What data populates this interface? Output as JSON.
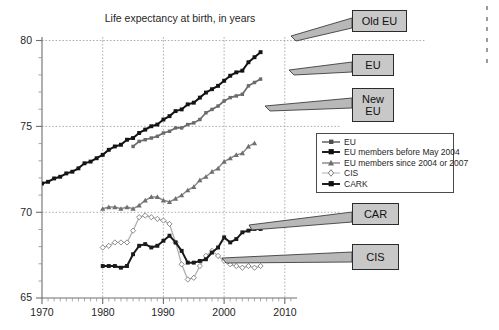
{
  "chart_data": {
    "type": "line",
    "title": "Life expectancy at birth, in years",
    "xlabel": "",
    "ylabel": "",
    "xlim": [
      1970,
      2012
    ],
    "ylim": [
      65,
      80.5
    ],
    "xticks": [
      "1970",
      "1980",
      "1990",
      "2000",
      "2010"
    ],
    "yticks": [
      "65",
      "70",
      "75",
      "80"
    ],
    "grid": true,
    "grid_style": "dotted",
    "legend_position": "middle-right",
    "minor_tick_interval": 1,
    "series": [
      {
        "name": "EU",
        "legend_label": "EU",
        "color": "#6b6b6b",
        "marker": "square-small",
        "x": [
          1985,
          1986,
          1987,
          1988,
          1989,
          1990,
          1991,
          1992,
          1993,
          1994,
          1995,
          1996,
          1997,
          1998,
          1999,
          2000,
          2001,
          2002,
          2003,
          2004,
          2005,
          2006
        ],
        "y": [
          74.0,
          74.3,
          74.4,
          74.5,
          74.6,
          74.8,
          74.9,
          75.1,
          75.1,
          75.3,
          75.4,
          75.6,
          76.0,
          76.2,
          76.4,
          76.7,
          76.9,
          77.0,
          77.1,
          77.6,
          77.8,
          78.0
        ]
      },
      {
        "name": "Old EU",
        "legend_label": "EU members before May 2004",
        "color": "#141414",
        "marker": "square-small",
        "x": [
          1970,
          1971,
          1972,
          1973,
          1974,
          1975,
          1976,
          1977,
          1978,
          1979,
          1980,
          1981,
          1982,
          1983,
          1984,
          1985,
          1986,
          1987,
          1988,
          1989,
          1990,
          1991,
          1992,
          1993,
          1994,
          1995,
          1996,
          1997,
          1998,
          1999,
          2000,
          2001,
          2002,
          2003,
          2004,
          2005,
          2006
        ],
        "y": [
          71.8,
          71.9,
          72.1,
          72.2,
          72.4,
          72.5,
          72.7,
          73.0,
          73.1,
          73.3,
          73.5,
          73.8,
          74.0,
          74.1,
          74.4,
          74.5,
          74.8,
          75.0,
          75.2,
          75.3,
          75.6,
          75.8,
          76.1,
          76.2,
          76.5,
          76.6,
          76.9,
          77.2,
          77.4,
          77.6,
          77.9,
          78.2,
          78.4,
          78.5,
          79.0,
          79.3,
          79.6
        ]
      },
      {
        "name": "New EU",
        "legend_label": "EU members since 2004 or 2007",
        "color": "#8c8c8c",
        "marker": "triangle-small",
        "x": [
          1980,
          1981,
          1982,
          1983,
          1984,
          1985,
          1986,
          1987,
          1988,
          1989,
          1990,
          1991,
          1992,
          1993,
          1994,
          1995,
          1996,
          1997,
          1998,
          1999,
          2000,
          2001,
          2002,
          2003,
          2004,
          2005
        ],
        "y": [
          70.3,
          70.4,
          70.4,
          70.3,
          70.4,
          70.3,
          70.5,
          70.8,
          71.0,
          71.0,
          70.8,
          70.7,
          70.9,
          71.1,
          71.4,
          71.6,
          72.0,
          72.2,
          72.5,
          72.7,
          73.1,
          73.3,
          73.5,
          73.6,
          74.0,
          74.2
        ]
      },
      {
        "name": "CIS",
        "legend_label": "CIS",
        "color": "#b0b0b0",
        "marker": "diamond-open",
        "x": [
          1980,
          1981,
          1982,
          1983,
          1984,
          1985,
          1986,
          1987,
          1988,
          1989,
          1990,
          1991,
          1992,
          1993,
          1994,
          1995,
          1996,
          1997,
          1998,
          1999,
          2000,
          2001,
          2002,
          2003,
          2004,
          2005,
          2006
        ],
        "y": [
          68.0,
          68.1,
          68.3,
          68.3,
          68.3,
          69.0,
          69.8,
          69.9,
          69.8,
          69.7,
          69.6,
          69.4,
          68.3,
          67.0,
          66.1,
          66.2,
          66.9,
          67.5,
          67.8,
          67.5,
          67.2,
          67.0,
          66.9,
          66.8,
          66.9,
          66.8,
          66.9
        ]
      },
      {
        "name": "CARK",
        "legend_label": "CARK",
        "color": "#1a1a1a",
        "marker": "square-small",
        "x": [
          1980,
          1981,
          1982,
          1983,
          1984,
          1985,
          1986,
          1987,
          1988,
          1989,
          1990,
          1991,
          1992,
          1993,
          1994,
          1995,
          1996,
          1997,
          1998,
          1999,
          2000,
          2001,
          2002,
          2003,
          2004,
          2005,
          2006
        ],
        "y": [
          66.9,
          66.9,
          66.9,
          66.8,
          66.9,
          67.6,
          68.1,
          68.2,
          68.0,
          68.1,
          68.4,
          68.7,
          68.3,
          67.8,
          67.1,
          67.1,
          67.2,
          67.3,
          67.7,
          68.0,
          68.6,
          68.3,
          68.5,
          68.9,
          69.0,
          69.1,
          69.1
        ]
      }
    ]
  },
  "legend": {
    "items": [
      {
        "label": "EU",
        "key": "line-square-dark"
      },
      {
        "label": "EU members before May 2004",
        "key": "line-square-black"
      },
      {
        "label": "EU members since 2004 or 2007",
        "key": "line-triangle-gray"
      },
      {
        "label": "CIS",
        "key": "line-diamond-light"
      },
      {
        "label": "CARK",
        "key": "line-square-black2"
      }
    ]
  },
  "callouts": [
    {
      "id": "old-eu",
      "label": "Old EU"
    },
    {
      "id": "eu",
      "label": "EU"
    },
    {
      "id": "new-eu",
      "label": "New\nEU"
    },
    {
      "id": "new-eu-line1",
      "label": "New"
    },
    {
      "id": "new-eu-line2",
      "label": "EU"
    },
    {
      "id": "car",
      "label": "CAR"
    },
    {
      "id": "cis",
      "label": "CIS"
    }
  ],
  "axis": {
    "x_labels": [
      "1970",
      "1980",
      "1990",
      "2000",
      "2010"
    ],
    "y_labels": [
      "80",
      "75",
      "70",
      "65"
    ]
  },
  "colors": {
    "callout_fill": "#c8c8c8",
    "callout_border": "#2b2b2b",
    "grid": "#9a9a9a",
    "axis": "#6e6e6e",
    "text": "#1f1f1f"
  }
}
